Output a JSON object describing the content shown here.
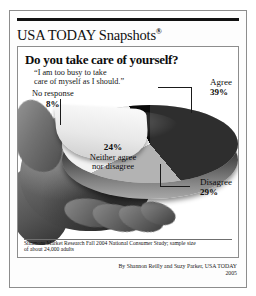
{
  "masthead": {
    "brand": "USA TODAY Snapshots",
    "registered_mark": "®"
  },
  "headline": "Do you take care of yourself?",
  "subhead_line1": "“I am too busy to take",
  "subhead_line2": "care of myself as I should.”",
  "labels": {
    "agree_name": "Agree",
    "agree_value": "39%",
    "disagree_name": "Disagree",
    "disagree_value": "29%",
    "neither_value": "24%",
    "neither_line1": "Neither agree",
    "neither_line2": "nor disagree",
    "noresponse_name": "No response",
    "noresponse_value": "8%"
  },
  "source_line1": "Simmons Market Research Fall 2004 National Consumer Study; sample size",
  "source_line2": "of about 24,000 adults",
  "byline": "By Shannon Reilly and Suzy Parker, USA TODAY",
  "year": "2005",
  "chart_data": {
    "type": "pie",
    "title": "Do you take care of yourself?",
    "subtitle": "“I am too busy to take care of myself as I should.”",
    "categories": [
      "Agree",
      "Disagree",
      "Neither agree nor disagree",
      "No response"
    ],
    "values": [
      39,
      29,
      24,
      8
    ],
    "unit": "percent",
    "labels_shown": [
      "Agree 39%",
      "Disagree 29%",
      "24% Neither agree nor disagree",
      "No response 8%"
    ],
    "colors": [
      "#2c2c2c",
      "#b3b3b3",
      "#f2f2f2",
      "#0a0a0a"
    ],
    "legend": "callout labels with leader lines",
    "grid": false,
    "source": "Simmons Market Research Fall 2004 National Consumer Study; sample size of about 24,000 adults"
  }
}
